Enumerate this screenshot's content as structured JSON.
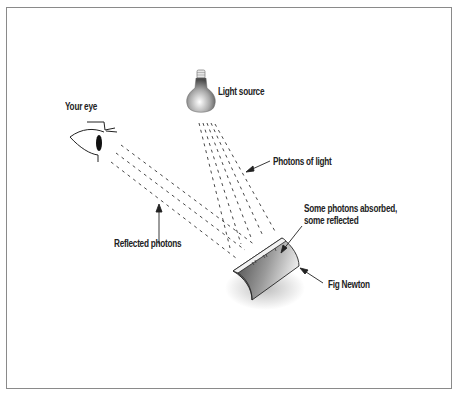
{
  "diagram": {
    "labels": {
      "your_eye": "Your eye",
      "light_source": "Light source",
      "photons_of_light": "Photons of light",
      "absorbed_line1": "Some photons absorbed,",
      "absorbed_line2": "some reflected",
      "reflected_photons": "Reflected photons",
      "fig_newton": "Fig Newton"
    },
    "colors": {
      "frame": "#8a8a8a",
      "ink": "#222222",
      "cookie_dark": "#3a3a3a",
      "cookie_light": "#d8d8d8"
    }
  }
}
